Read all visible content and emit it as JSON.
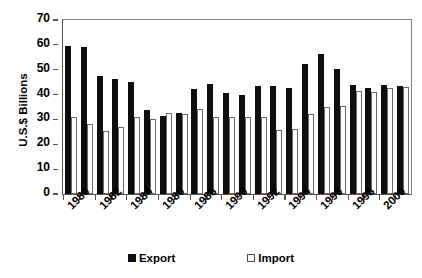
{
  "chart_data": {
    "type": "bar",
    "title": "",
    "subtitle": "",
    "xlabel": "",
    "ylabel": "U.S.$ Billions",
    "ylim": [
      0,
      70
    ],
    "ytick_step": 10,
    "yticks": [
      70,
      60,
      50,
      40,
      30,
      20,
      10,
      0
    ],
    "grid": false,
    "legend_position": "bottom",
    "x_tick_label_rotation": -45,
    "x_label_interval": 2,
    "categories": [
      "1980",
      "1981",
      "1982",
      "1983",
      "1984",
      "1985",
      "1986",
      "1987",
      "1988",
      "1989",
      "1990",
      "1991",
      "1992",
      "1993",
      "1994",
      "1995",
      "1996",
      "1997",
      "1998",
      "1999",
      "2000",
      "2001"
    ],
    "visible_tick_labels": [
      "1980",
      "",
      "1982",
      "",
      "1984",
      "",
      "1986",
      "",
      "1988",
      "",
      "1990",
      "",
      "1992",
      "",
      "1994",
      "",
      "1996",
      "",
      "1998",
      "",
      "2000",
      ""
    ],
    "series": [
      {
        "name": "Export",
        "color": "#0d0d0d",
        "values": [
          59.5,
          59.3,
          47.5,
          46.3,
          45.0,
          33.8,
          31.4,
          32.5,
          42.3,
          44.3,
          40.5,
          40.0,
          43.5,
          43.5,
          42.5,
          52.3,
          56.2,
          50.3,
          44.0,
          42.8,
          44.0,
          43.3
        ]
      },
      {
        "name": "Import",
        "color": "#ffffff",
        "border_color": "#6b6b6b",
        "values": [
          30.8,
          28.2,
          25.5,
          27.0,
          30.8,
          30.0,
          32.5,
          32.3,
          34.3,
          31.0,
          30.8,
          30.8,
          30.8,
          25.8,
          26.0,
          32.0,
          35.0,
          35.3,
          41.3,
          41.0,
          42.8,
          43.0
        ]
      }
    ]
  },
  "legend": {
    "entries": [
      {
        "label": "Export",
        "swatch": "filled-square-icon"
      },
      {
        "label": "Import",
        "swatch": "outlined-square-icon"
      }
    ]
  },
  "axis": {
    "y_title": "U.S.$ Billions"
  }
}
